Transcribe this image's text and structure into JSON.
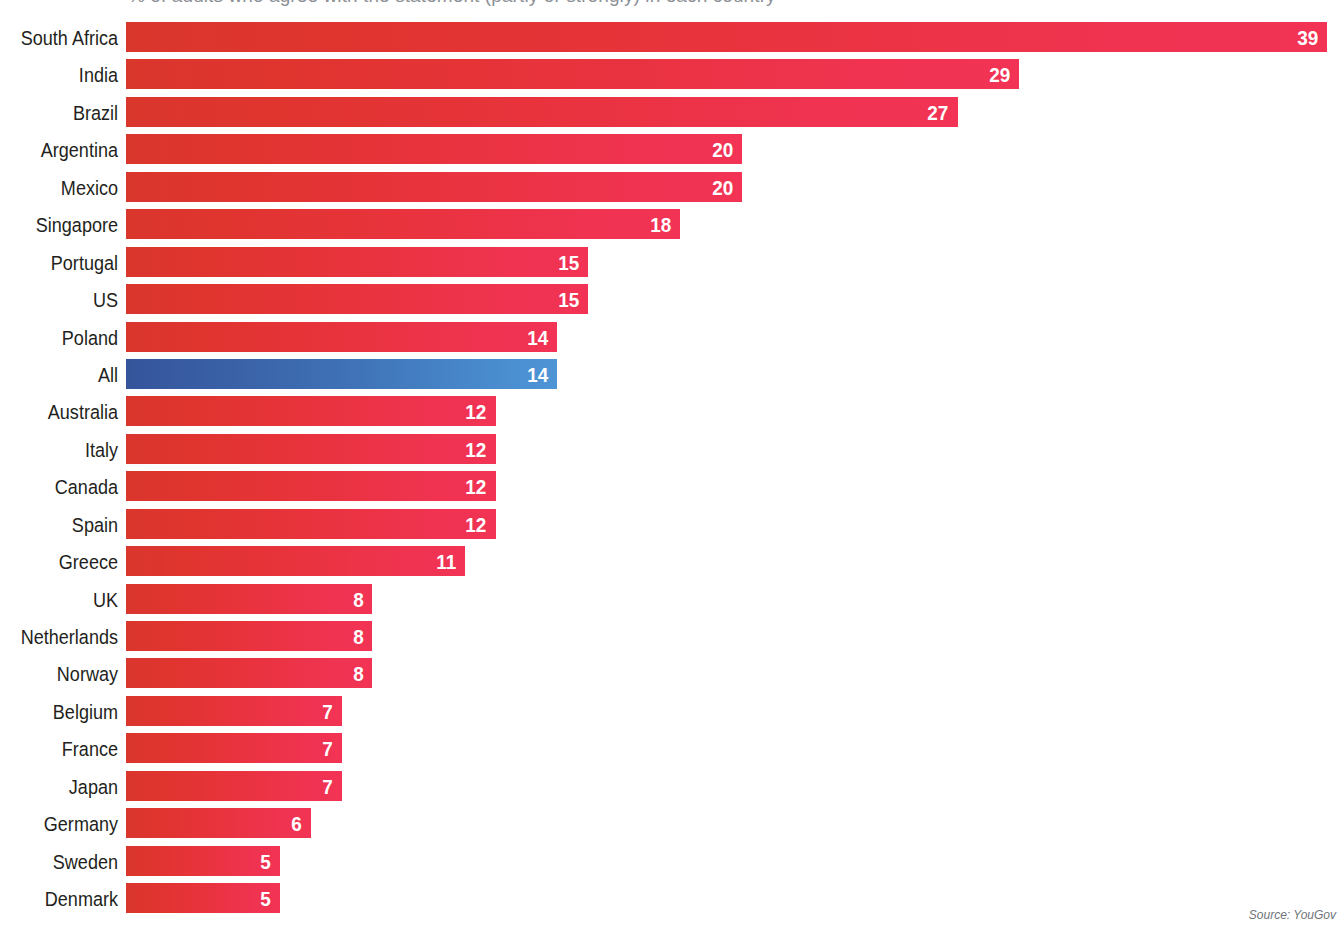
{
  "title_sliver": "% of adults who agree with the statement (partly or strongly) in each country",
  "source_note": "Source: YouGov",
  "colors": {
    "bar_red_left": "#d9362c",
    "bar_red_right": "#f23355",
    "bar_blue_left": "#35559b",
    "bar_blue_right": "#4e95d6",
    "label_text": "#231f20",
    "value_text": "#ffffff",
    "source_text": "#6f7378",
    "background": "#ffffff"
  },
  "chart_data": {
    "type": "bar",
    "orientation": "horizontal",
    "title": "",
    "subtitle": "",
    "xlabel": "",
    "ylabel": "",
    "xlim": [
      0,
      39
    ],
    "grid": false,
    "legend": "none",
    "value_labels_inside_bars": true,
    "highlight_category": "All",
    "highlight_color": "#35559b",
    "series_color": "#e8333c",
    "categories": [
      "South Africa",
      "India",
      "Brazil",
      "Argentina",
      "Mexico",
      "Singapore",
      "Portugal",
      "US",
      "Poland",
      "All",
      "Australia",
      "Italy",
      "Canada",
      "Spain",
      "Greece",
      "UK",
      "Netherlands",
      "Norway",
      "Belgium",
      "France",
      "Japan",
      "Germany",
      "Sweden",
      "Denmark"
    ],
    "values": [
      39,
      29,
      27,
      20,
      20,
      18,
      15,
      15,
      14,
      14,
      12,
      12,
      12,
      12,
      11,
      8,
      8,
      8,
      7,
      7,
      7,
      6,
      5,
      5
    ],
    "bars": [
      {
        "label": "South Africa",
        "value": 39,
        "value_text": "39",
        "highlight": false
      },
      {
        "label": "India",
        "value": 29,
        "value_text": "29",
        "highlight": false
      },
      {
        "label": "Brazil",
        "value": 27,
        "value_text": "27",
        "highlight": false
      },
      {
        "label": "Argentina",
        "value": 20,
        "value_text": "20",
        "highlight": false
      },
      {
        "label": "Mexico",
        "value": 20,
        "value_text": "20",
        "highlight": false
      },
      {
        "label": "Singapore",
        "value": 18,
        "value_text": "18",
        "highlight": false
      },
      {
        "label": "Portugal",
        "value": 15,
        "value_text": "15",
        "highlight": false
      },
      {
        "label": "US",
        "value": 15,
        "value_text": "15",
        "highlight": false
      },
      {
        "label": "Poland",
        "value": 14,
        "value_text": "14",
        "highlight": false
      },
      {
        "label": "All",
        "value": 14,
        "value_text": "14",
        "highlight": true
      },
      {
        "label": "Australia",
        "value": 12,
        "value_text": "12",
        "highlight": false
      },
      {
        "label": "Italy",
        "value": 12,
        "value_text": "12",
        "highlight": false
      },
      {
        "label": "Canada",
        "value": 12,
        "value_text": "12",
        "highlight": false
      },
      {
        "label": "Spain",
        "value": 12,
        "value_text": "12",
        "highlight": false
      },
      {
        "label": "Greece",
        "value": 11,
        "value_text": "11",
        "highlight": false
      },
      {
        "label": "UK",
        "value": 8,
        "value_text": "8",
        "highlight": false
      },
      {
        "label": "Netherlands",
        "value": 8,
        "value_text": "8",
        "highlight": false
      },
      {
        "label": "Norway",
        "value": 8,
        "value_text": "8",
        "highlight": false
      },
      {
        "label": "Belgium",
        "value": 7,
        "value_text": "7",
        "highlight": false
      },
      {
        "label": "France",
        "value": 7,
        "value_text": "7",
        "highlight": false
      },
      {
        "label": "Japan",
        "value": 7,
        "value_text": "7",
        "highlight": false
      },
      {
        "label": "Germany",
        "value": 6,
        "value_text": "6",
        "highlight": false
      },
      {
        "label": "Sweden",
        "value": 5,
        "value_text": "5",
        "highlight": false
      },
      {
        "label": "Denmark",
        "value": 5,
        "value_text": "5",
        "highlight": false
      }
    ]
  }
}
